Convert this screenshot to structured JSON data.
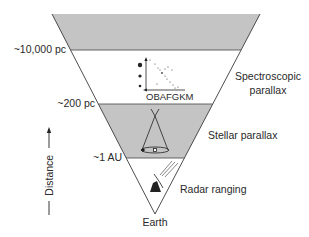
{
  "diagram": {
    "type": "distance-ladder-triangle",
    "colors": {
      "band_fill": "#c4c4c4",
      "line": "#3a3a3a",
      "background": "#ffffff"
    },
    "boundaries": [
      {
        "label": "~10,000 pc"
      },
      {
        "label": "~200 pc"
      },
      {
        "label": "~1 AU"
      }
    ],
    "methods": [
      {
        "label": "Spectroscopic\nparallax",
        "line1": "Spectroscopic",
        "line2": "parallax",
        "icon": "hr-diagram-icon"
      },
      {
        "label": "Stellar parallax",
        "icon": "parallax-cone-icon"
      },
      {
        "label": "Radar ranging",
        "icon": "radar-dish-icon"
      }
    ],
    "hr_axis_label": "OBAFGKM",
    "apex_label": "Earth",
    "axis": {
      "label": "Distance",
      "direction": "up"
    }
  }
}
